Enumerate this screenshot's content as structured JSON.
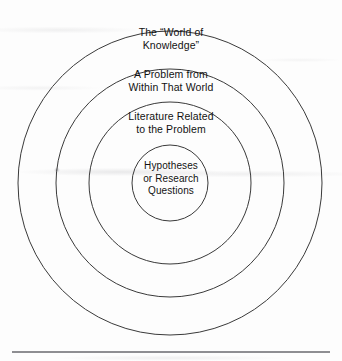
{
  "figure": {
    "type": "concentric-circles-diagram",
    "rings": [
      {
        "id": "world-of-knowledge",
        "level": 1,
        "label": "The “World of\nKnowledge”",
        "radius": 152
      },
      {
        "id": "problem-from-world",
        "level": 2,
        "label": "A Problem from\nWithin That World",
        "radius": 114
      },
      {
        "id": "literature-related",
        "level": 3,
        "label": "Literature Related\nto the Problem",
        "radius": 81
      },
      {
        "id": "hypotheses-or-research-questions",
        "level": 4,
        "label": "Hypotheses\nor Research\nQuestions",
        "radius": 38
      }
    ],
    "center": {
      "x": 170,
      "y": 183
    },
    "stroke_color": "#3a3a3a",
    "background_color": "#fdfdfd",
    "text_color": "#121212",
    "rule_color": "#8e8e92"
  }
}
